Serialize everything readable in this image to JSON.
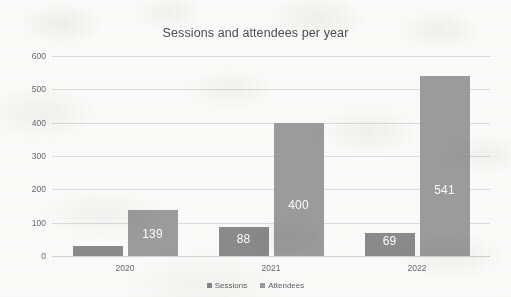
{
  "chart_data": {
    "type": "bar",
    "title": "Sessions and attendees per year",
    "subtitle": "",
    "xlabel": "",
    "ylabel": "",
    "categories": [
      "2020",
      "2021",
      "2022"
    ],
    "series": [
      {
        "name": "Sessions",
        "color": "#8b8b8b",
        "values": [
          30,
          88,
          69
        ],
        "labels": [
          "",
          "88",
          "69"
        ]
      },
      {
        "name": "Attendees",
        "color": "#9c9c9c",
        "values": [
          139,
          400,
          541
        ],
        "labels": [
          "139",
          "400",
          "541"
        ]
      }
    ],
    "ylim": [
      0,
      600
    ],
    "yticks": [
      "0",
      "100",
      "200",
      "300",
      "400",
      "500",
      "600"
    ],
    "ytick_values": [
      0,
      100,
      200,
      300,
      400,
      500,
      600
    ],
    "grid": "horizontal",
    "legend_position": "bottom-center",
    "data_labels": true,
    "data_label_color": "#ffffff"
  },
  "legend": {
    "items": [
      {
        "label": "Sessions",
        "marker": "square-swatch-icon",
        "color": "#8b8b8b"
      },
      {
        "label": "Attendees",
        "marker": "square-swatch-icon",
        "color": "#9c9c9c"
      }
    ]
  },
  "style": {
    "background": "#fbfbf9",
    "title_color": "#4d4d4d",
    "axis_text_color": "#6a6a6a",
    "gridline_color": "#dcdcdc"
  }
}
